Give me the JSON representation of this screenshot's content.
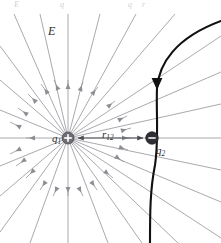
{
  "figure": {
    "kind": "physics-diagram",
    "background_color": "#ffffff",
    "field_line_color": "#9a9aa0",
    "trajectory_color": "#111111",
    "separation_arrow_color": "#55555c",
    "positive_charge_color": "#6e6e76",
    "negative_charge_color": "#2e2e33",
    "labels": {
      "field": "E",
      "charge_1": "q",
      "charge_1_sub": "1",
      "charge_2": "q",
      "charge_2_sub": "2",
      "separation": "r",
      "separation_sub": "12"
    },
    "charges": {
      "q1": {
        "sign": "+",
        "x": 68,
        "y": 138,
        "radius": 6
      },
      "q2": {
        "sign": "−",
        "x": 152,
        "y": 138,
        "radius": 6
      }
    },
    "field_line_count": 28,
    "trajectory": {
      "arrow_direction": "down",
      "arrow_x": 157,
      "arrow_y": 85
    }
  },
  "clipped_header": {
    "fragments": [
      {
        "text": "E",
        "x": 14,
        "y": 1
      },
      {
        "text": "q",
        "x": 60,
        "y": 1
      },
      {
        "text": "q",
        "x": 128,
        "y": 1
      },
      {
        "text": "r",
        "x": 142,
        "y": 1
      }
    ]
  }
}
